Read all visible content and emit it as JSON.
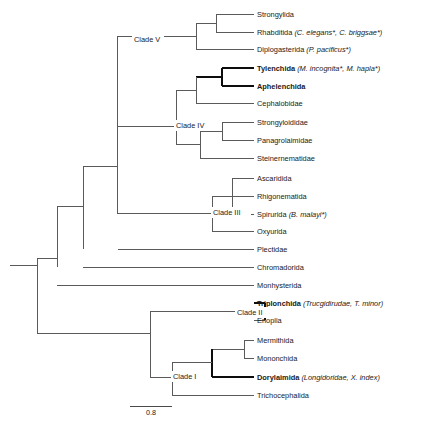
{
  "figure": {
    "kind": "phylogenetic-cladogram",
    "title": "",
    "line_color": "#5a5a5a",
    "bold_line_color": "#0d0d0d",
    "text_color": "#1a1a1a",
    "background": "#ffffff"
  },
  "scale_bar": {
    "label": "0.8",
    "x1": 130,
    "x2": 172,
    "y": 406
  },
  "taxa": [
    {
      "id": "strongylida",
      "name": "Strongylida",
      "detail": "",
      "bold": false,
      "y": 14,
      "branch_x": 216
    },
    {
      "id": "rhabditida",
      "name": "Rhabditida",
      "detail": "(C. elegans*, C. briggsae*)",
      "bold": false,
      "y": 32,
      "branch_x": 216
    },
    {
      "id": "diplogasterida",
      "name": "Diplogasterida",
      "detail": "(P. pacificus*)",
      "bold": false,
      "y": 49,
      "branch_x": 196
    },
    {
      "id": "tylenchida",
      "name": "Tylenchida",
      "detail": "(M. incognita*, M. hapla*)",
      "bold": true,
      "y": 68,
      "branch_x": 222
    },
    {
      "id": "aphelenchida",
      "name": "Aphelenchida",
      "detail": "",
      "bold": true,
      "y": 86,
      "branch_x": 222
    },
    {
      "id": "cephalobidae",
      "name": "Cephalobidae",
      "detail": "",
      "bold": false,
      "y": 103,
      "branch_x": 196
    },
    {
      "id": "strongyloididae",
      "name": "Strongyloididae",
      "detail": "",
      "bold": false,
      "y": 122,
      "branch_x": 222
    },
    {
      "id": "panagrolaimidae",
      "name": "Panagrolaimidae",
      "detail": "",
      "bold": false,
      "y": 140,
      "branch_x": 222
    },
    {
      "id": "steinernematidae",
      "name": "Steinernematidae",
      "detail": "",
      "bold": false,
      "y": 158,
      "branch_x": 200
    },
    {
      "id": "ascaridida",
      "name": "Ascaridida",
      "detail": "",
      "bold": false,
      "y": 178,
      "branch_x": 232
    },
    {
      "id": "rhigonematida",
      "name": "Rhigonematida",
      "detail": "",
      "bold": false,
      "y": 196,
      "branch_x": 232
    },
    {
      "id": "spirurida",
      "name": "Spirurida",
      "detail": "(B. malayi*)",
      "bold": false,
      "y": 214,
      "branch_x": 232
    },
    {
      "id": "oxyurida",
      "name": "Oxyurida",
      "detail": "",
      "bold": false,
      "y": 231,
      "branch_x": 212
    },
    {
      "id": "plectidae",
      "name": "Plectidae",
      "detail": "",
      "bold": false,
      "y": 249,
      "branch_x": 118
    },
    {
      "id": "chromadorida",
      "name": "Chromadorida",
      "detail": "",
      "bold": false,
      "y": 267,
      "branch_x": 83
    },
    {
      "id": "monhysterida",
      "name": "Monhysterida",
      "detail": "",
      "bold": false,
      "y": 285,
      "branch_x": 57
    },
    {
      "id": "triplonchida",
      "name": "Triplonchida",
      "detail": "(Trucgidirudae, T. minor)",
      "bold": true,
      "y": 303,
      "branch_x": 265
    },
    {
      "id": "enoplia",
      "name": "Enoplia",
      "detail": "",
      "bold": false,
      "y": 320,
      "branch_x": 265
    },
    {
      "id": "mermithida",
      "name": "Mermithida",
      "detail": "",
      "bold": false,
      "y": 340,
      "branch_x": 244
    },
    {
      "id": "mononchida",
      "name": "Mononchida",
      "detail": "",
      "bold": false,
      "y": 358,
      "branch_x": 244
    },
    {
      "id": "dorylaimida",
      "name": "Dorylaimida",
      "detail": "(Longidoridae, X. index)",
      "bold": true,
      "y": 377,
      "branch_x": 212
    },
    {
      "id": "trichocephalida",
      "name": "Trichocephalida",
      "detail": "",
      "bold": false,
      "y": 395,
      "branch_x": 172
    }
  ],
  "clades": [
    {
      "id": "clade-v",
      "label": "Clade V",
      "x": 134,
      "y": 40,
      "bold": false
    },
    {
      "id": "clade-iv",
      "label": "Clade IV",
      "x": 176,
      "y": 126,
      "bold": false
    },
    {
      "id": "clade-iii",
      "label": "Clade III",
      "x": 213,
      "y": 213,
      "bold": false
    },
    {
      "id": "clade-ii",
      "label": "Clade II",
      "x": 237,
      "y": 313,
      "bold": true
    },
    {
      "id": "clade-i",
      "label": "Clade I",
      "x": 173,
      "y": 377,
      "bold": false
    }
  ],
  "label_x": 257,
  "branches": {
    "note": "tree topology rendered as orthogonal cladogram paths"
  }
}
